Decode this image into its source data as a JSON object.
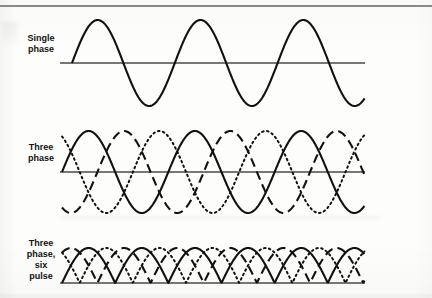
{
  "figure": {
    "background_color": "#fdfdfc",
    "ink_color": "#111111",
    "rule_color": "#8a8a8a",
    "width": 432,
    "height": 298
  },
  "panels": [
    {
      "id": "single-phase",
      "label_lines": [
        "Single",
        "phase"
      ],
      "label_text": "Single phase",
      "baseline_y": 63,
      "amplitude": 43,
      "axis_x_start": 60,
      "axis_x_end": 365,
      "wave_x_start": 72,
      "cycles": 2.85,
      "traces": [
        {
          "name": "phase-a",
          "style": "solid",
          "phase_deg": 0,
          "rectified": false
        }
      ]
    },
    {
      "id": "three-phase",
      "label_lines": [
        "Three",
        "phase"
      ],
      "label_text": "Three phase",
      "baseline_y": 172,
      "amplitude": 41,
      "axis_x_start": 60,
      "axis_x_end": 365,
      "wave_x_start": 62,
      "cycles": 2.85,
      "traces": [
        {
          "name": "phase-a",
          "style": "solid",
          "phase_deg": 0,
          "rectified": false
        },
        {
          "name": "phase-b",
          "style": "dashed",
          "phase_deg": 120,
          "rectified": false
        },
        {
          "name": "phase-c",
          "style": "dotted",
          "phase_deg": 240,
          "rectified": false
        }
      ]
    },
    {
      "id": "three-phase-six-pulse",
      "label_lines": [
        "Three",
        "phase,",
        "six",
        "pulse"
      ],
      "label_text": "Three phase, six pulse",
      "baseline_y": 283,
      "amplitude": 35,
      "axis_x_start": 60,
      "axis_x_end": 365,
      "wave_x_start": 62,
      "cycles": 2.85,
      "traces": [
        {
          "name": "phase-a",
          "style": "solid",
          "phase_deg": 0,
          "rectified": true
        },
        {
          "name": "phase-b",
          "style": "dashed",
          "phase_deg": 120,
          "rectified": true
        },
        {
          "name": "phase-c",
          "style": "dotted",
          "phase_deg": 240,
          "rectified": true
        }
      ]
    }
  ],
  "chart_data": {
    "type": "line",
    "xlabel": "",
    "ylabel": "",
    "grid": false,
    "legend": "none",
    "x": [
      0,
      1026
    ],
    "ylim": [
      -1,
      1
    ],
    "subplots": [
      {
        "name": "Single phase",
        "cycles": 2.85,
        "series": [
          {
            "name": "phase-a",
            "style": "solid",
            "phase_deg": 0,
            "amplitude": 1.0,
            "rectified": false
          }
        ]
      },
      {
        "name": "Three phase",
        "cycles": 2.85,
        "series": [
          {
            "name": "phase-a",
            "style": "solid",
            "phase_deg": 0,
            "amplitude": 1.0,
            "rectified": false
          },
          {
            "name": "phase-b",
            "style": "dashed",
            "phase_deg": 120,
            "amplitude": 1.0,
            "rectified": false
          },
          {
            "name": "phase-c",
            "style": "dotted",
            "phase_deg": 240,
            "amplitude": 1.0,
            "rectified": false
          }
        ]
      },
      {
        "name": "Three phase, six pulse",
        "cycles": 2.85,
        "series": [
          {
            "name": "phase-a",
            "style": "solid",
            "phase_deg": 0,
            "amplitude": 1.0,
            "rectified": true
          },
          {
            "name": "phase-b",
            "style": "dashed",
            "phase_deg": 120,
            "amplitude": 1.0,
            "rectified": true
          },
          {
            "name": "phase-c",
            "style": "dotted",
            "phase_deg": 240,
            "amplitude": 1.0,
            "rectified": true
          }
        ]
      }
    ]
  }
}
